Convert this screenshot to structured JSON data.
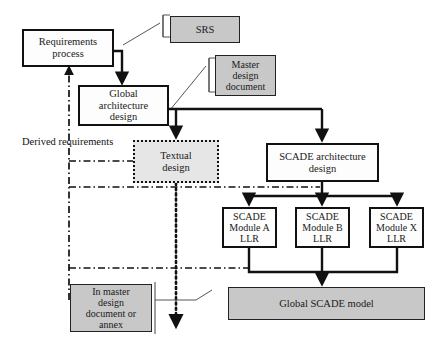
{
  "diagram": {
    "colors": {
      "gray_fill": "#c8c8c8",
      "white_fill": "#fdfdfd",
      "dotted_fill": "#e6e6e6",
      "line": "#111111"
    },
    "annotations": [
      {
        "name": "derived-requirements-label",
        "text": "Derived requirements"
      }
    ],
    "nodes": [
      {
        "id": "requirements-process",
        "text": "Requirements\nprocess",
        "style": "solid",
        "x": 22,
        "y": 29,
        "w": 92,
        "h": 38,
        "fs": 10.5
      },
      {
        "id": "srs",
        "text": "SRS",
        "style": "gray",
        "x": 170,
        "y": 16,
        "w": 70,
        "h": 27,
        "fs": 10.5
      },
      {
        "id": "global-architecture",
        "text": "Global\narchitecture\ndesign",
        "style": "solid",
        "x": 78,
        "y": 85,
        "w": 91,
        "h": 41,
        "fs": 10.5
      },
      {
        "id": "master-design-document",
        "text": "Master\ndesign\ndocument",
        "style": "gray",
        "x": 215,
        "y": 55,
        "w": 61,
        "h": 41,
        "fs": 10.0
      },
      {
        "id": "textual-design",
        "text": "Textual\ndesign",
        "style": "dotted",
        "x": 133,
        "y": 140,
        "w": 86,
        "h": 43,
        "fs": 10.5
      },
      {
        "id": "scade-architecture",
        "text": "SCADE architecture\ndesign",
        "style": "solid",
        "x": 266,
        "y": 143,
        "w": 113,
        "h": 39,
        "fs": 10.5
      },
      {
        "id": "scade-module-a",
        "text": "SCADE\nModule A\nLLR",
        "style": "solid",
        "x": 222,
        "y": 207,
        "w": 55,
        "h": 41,
        "fs": 10.0
      },
      {
        "id": "scade-module-b",
        "text": "SCADE\nModule B\nLLR",
        "style": "solid",
        "x": 295,
        "y": 207,
        "w": 55,
        "h": 41,
        "fs": 10.0
      },
      {
        "id": "scade-module-x",
        "text": "SCADE\nModule X\nLLR",
        "style": "solid",
        "x": 369,
        "y": 207,
        "w": 55,
        "h": 41,
        "fs": 10.0
      },
      {
        "id": "global-scade-model",
        "text": "Global SCADE model",
        "style": "gray",
        "x": 228,
        "y": 287,
        "w": 197,
        "h": 33,
        "fs": 10.5
      },
      {
        "id": "in-master-design",
        "text": "In master\ndesign\ndocument or\nannex",
        "style": "gray",
        "x": 70,
        "y": 284,
        "w": 82,
        "h": 48,
        "fs": 10.0
      }
    ]
  }
}
